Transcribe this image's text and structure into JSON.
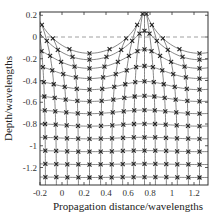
{
  "chart_data": {
    "type": "line",
    "title": "",
    "xlabel": "Propagation distance/wavelengths",
    "ylabel": "Depth/wavelengths",
    "xlim": [
      -0.2,
      1.3
    ],
    "ylim": [
      -1.35,
      0.22
    ],
    "xticks": [
      -0.2,
      0,
      0.2,
      0.4,
      0.6,
      0.8,
      1,
      1.2
    ],
    "xtick_labels": [
      "-0.2",
      "0",
      "0.2",
      "0.4",
      "0.6",
      "0.8",
      "1",
      "1.2"
    ],
    "yticks": [
      0.2,
      0,
      -0.2,
      -0.4,
      -0.6,
      -0.8,
      -1,
      -1.2
    ],
    "ytick_labels": [
      "0.2",
      "0",
      "-0.2",
      "-0.4",
      "-0.6",
      "-0.8",
      "-1",
      "-1.2"
    ],
    "grid": false,
    "reference_line": {
      "y": 0,
      "style": "dashed",
      "color": "#888888"
    },
    "mesh": {
      "description": "Lagrangian particle mesh under a surface wave; crest near x=0.75, trough near x=0.25",
      "columns_x0": [
        -0.15,
        -0.05,
        0.05,
        0.15,
        0.25,
        0.35,
        0.45,
        0.55,
        0.65,
        0.75,
        0.85,
        0.95,
        1.05,
        1.15,
        1.25
      ],
      "rows_depth0": [
        0.05,
        -0.07,
        -0.19,
        -0.31,
        -0.43,
        -0.55,
        -0.67,
        -0.79,
        -0.91,
        -1.03,
        -1.15,
        -1.27
      ],
      "surface_amplitude": 0.2,
      "horizontal_amplitude": 0.14,
      "wavelength": 1.0,
      "crest_x": 0.75,
      "decay_per_wavelength": 6.2832,
      "marker": "x",
      "line_color": "#555555",
      "marker_color": "#222222"
    }
  }
}
